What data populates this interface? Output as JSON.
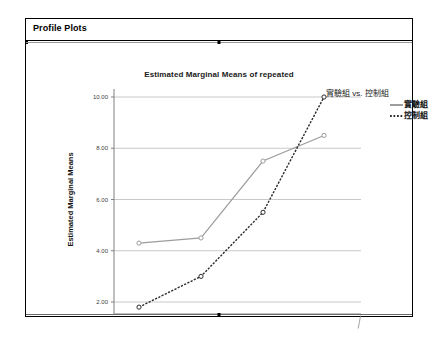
{
  "panel": {
    "title": "Profile Plots"
  },
  "chart_data": {
    "type": "line",
    "title": "Estimated Marginal Means of repeated",
    "xlabel": "time",
    "ylabel": "Estimated Marginal Means",
    "categories": [
      "1",
      "2",
      "3",
      "4"
    ],
    "x_tick_labels": [
      "1",
      "2",
      "3",
      "4"
    ],
    "y_tick_labels": [
      "2.00",
      "4.00",
      "6.00",
      "8.00",
      "10.00"
    ],
    "y_tick_values": [
      2.0,
      4.0,
      6.0,
      8.0,
      10.0
    ],
    "ylim": [
      1.2,
      10.6
    ],
    "xlim": [
      0.6,
      4.4
    ],
    "grid": "horizontal",
    "legend_position": "right",
    "legend_title": "實驗組 vs. 控制組",
    "series": [
      {
        "name": "實驗組",
        "style": "solid",
        "color": "#9d9d9d",
        "marker": "open-circle",
        "values": [
          4.3,
          4.5,
          7.5,
          8.5
        ]
      },
      {
        "name": "控制組",
        "style": "dashed",
        "color": "#2b2b2b",
        "marker": "open-circle",
        "values": [
          1.8,
          3.0,
          5.5,
          10.0
        ]
      }
    ]
  },
  "colors": {
    "panel_border": "#000000",
    "grid": "#c9c9c9",
    "axis": "#808080",
    "series_experimental": "#9d9d9d",
    "series_control": "#2b2b2b"
  }
}
